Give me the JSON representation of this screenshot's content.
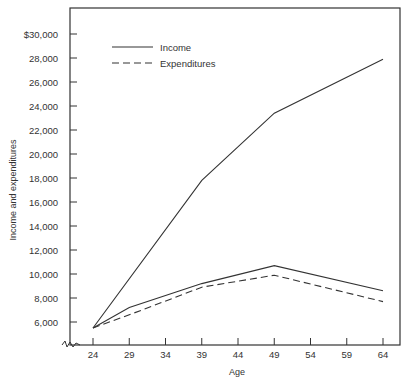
{
  "chart_data": {
    "type": "line",
    "title": "",
    "xlabel": "Age",
    "ylabel": "Income and expenditures",
    "x": [
      24,
      29,
      39,
      49,
      64
    ],
    "xticks": [
      24,
      29,
      34,
      39,
      44,
      49,
      54,
      59,
      64
    ],
    "yticks": [
      "6,000",
      "8,000",
      "10,000",
      "12,000",
      "14,000",
      "16,000",
      "18,000",
      "20,000",
      "22,000",
      "24,000",
      "26,000",
      "28,000",
      "$30,000"
    ],
    "ylim": [
      4200,
      31500
    ],
    "xlim": [
      24,
      64
    ],
    "grid": false,
    "legend_position": "upper-left",
    "series": [
      {
        "name": "Income",
        "style": "solid",
        "points": [
          [
            24,
            5500
          ],
          [
            39,
            17800
          ],
          [
            49,
            23400
          ],
          [
            64,
            27900
          ]
        ]
      },
      {
        "name": "Income",
        "style": "solid",
        "points": [
          [
            24,
            5500
          ],
          [
            29,
            7200
          ],
          [
            39,
            9200
          ],
          [
            49,
            10700
          ],
          [
            64,
            8600
          ]
        ]
      },
      {
        "name": "Expenditures",
        "style": "dashed",
        "points": [
          [
            24,
            5500
          ],
          [
            29,
            6600
          ],
          [
            39,
            8900
          ],
          [
            49,
            9900
          ],
          [
            64,
            7700
          ]
        ]
      }
    ],
    "legend": [
      {
        "label": "Income",
        "style": "solid"
      },
      {
        "label": "Expenditures",
        "style": "dashed"
      }
    ]
  }
}
